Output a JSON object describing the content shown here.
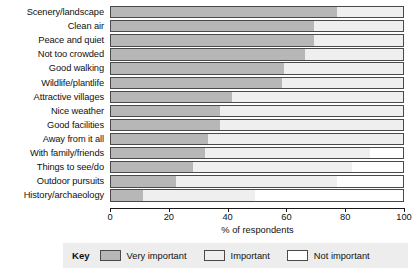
{
  "chart_data": {
    "type": "bar",
    "orientation": "horizontal",
    "stacked": true,
    "title": "",
    "xlabel": "% of respondents",
    "ylabel": "",
    "xlim": [
      0,
      100
    ],
    "xticks": [
      0,
      20,
      40,
      60,
      80,
      100
    ],
    "grid": false,
    "legend_position": "bottom",
    "legend_title": "Key",
    "categories": [
      "Scenery/landscape",
      "Clean air",
      "Peace and quiet",
      "Not too crowded",
      "Good walking",
      "Wildlife/plantlife",
      "Attractive villages",
      "Nice weather",
      "Good facilities",
      "Away from it all",
      "With family/friends",
      "Things to see/do",
      "Outdoor pursuits",
      "History/archaeology"
    ],
    "series": [
      {
        "name": "Very important",
        "color": "#b7b7b7",
        "values": [
          77,
          69,
          69,
          66,
          59,
          58,
          41,
          37,
          37,
          33,
          32,
          28,
          22,
          11
        ]
      },
      {
        "name": "Important",
        "color": "#efefef",
        "values": [
          23,
          31,
          31,
          34,
          41,
          42,
          59,
          63,
          63,
          67,
          56,
          54,
          55,
          38
        ]
      },
      {
        "name": "Not important",
        "color": "#ffffff",
        "values": [
          0,
          0,
          0,
          0,
          0,
          0,
          0,
          0,
          0,
          0,
          12,
          18,
          23,
          51
        ]
      }
    ]
  },
  "axis": {
    "x_title": "% of respondents",
    "tick_labels": [
      "0",
      "20",
      "40",
      "60",
      "80",
      "100"
    ]
  },
  "legend": {
    "title": "Key",
    "entries": [
      {
        "label": "Very important",
        "color": "#b7b7b7"
      },
      {
        "label": "Important",
        "color": "#efefef"
      },
      {
        "label": "Not important",
        "color": "#ffffff"
      }
    ]
  }
}
